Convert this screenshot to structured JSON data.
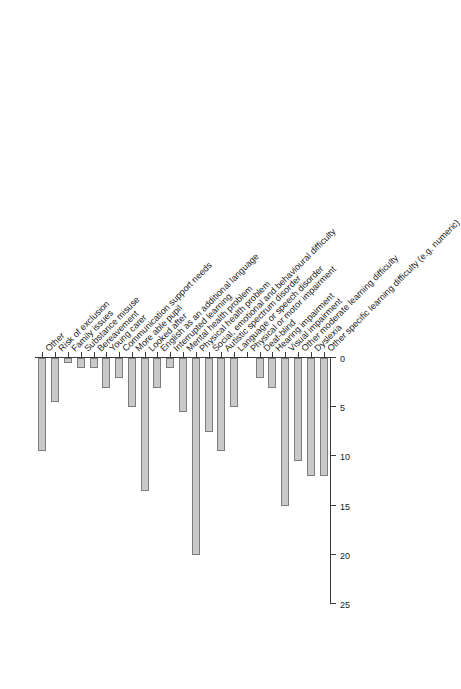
{
  "chart_data": {
    "type": "bar",
    "orientation": "horizontal",
    "title": "",
    "subtitle": "",
    "xlabel": "",
    "ylabel": "",
    "grid": false,
    "legend": null,
    "value_axis": {
      "ticks": [
        0,
        5,
        10,
        15,
        20,
        25
      ],
      "tick_labels": [
        "0",
        "5",
        "10",
        "15",
        "20",
        "25"
      ],
      "range": [
        0,
        25
      ]
    },
    "categories": [
      "Other specific learning difficulty (e.g. numeric)",
      "Dyslexia",
      "Other moderate learning difficulty",
      "Visual impairment",
      "Hearing impairment",
      "Deaf-blind",
      "Physical or motor impairment",
      "Language or speech disorder",
      "Autistic spectrum disorder",
      "Social, emotional and behavioural difficulty",
      "Physical health problem",
      "Mental health problem",
      "Interrupted learning",
      "English as an additional language",
      "Looked after",
      "More able pupil",
      "Communication support needs",
      "Young carer",
      "Bereavement",
      "Substance misuse",
      "Family issues",
      "Risk of exclusion",
      "Other"
    ],
    "values": [
      12,
      12,
      10.5,
      15,
      3,
      2,
      0,
      5,
      9.5,
      7.5,
      20,
      5.5,
      1,
      3,
      13.5,
      5,
      2,
      3,
      1,
      1,
      0.5,
      4.5,
      9.5
    ],
    "bar_fill_color": "#c9c9c9",
    "bar_border_color": "#7d7d7d",
    "axis_color": "#3a3a3a"
  }
}
